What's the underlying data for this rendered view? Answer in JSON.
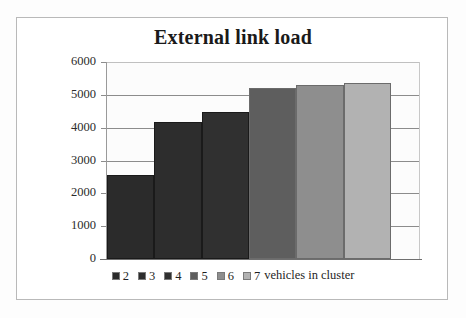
{
  "chart_data": {
    "type": "bar",
    "title": "External link load",
    "xlabel": "",
    "ylabel": "",
    "categories": [
      "2",
      "3",
      "4",
      "5",
      "6",
      "7"
    ],
    "values": [
      2570,
      4170,
      4480,
      5200,
      5300,
      5360
    ],
    "ylim": [
      0,
      6000
    ],
    "yticks": [
      "0",
      "1000",
      "2000",
      "3000",
      "4000",
      "5000",
      "6000"
    ],
    "ytick_values": [
      0,
      1000,
      2000,
      3000,
      4000,
      5000,
      6000
    ],
    "grid": true,
    "legend_position": "bottom",
    "series": [
      {
        "name": "2",
        "value": 2570,
        "color": "#2b2b2b"
      },
      {
        "name": "3",
        "value": 4170,
        "color": "#2d2d2d"
      },
      {
        "name": "4",
        "value": 4480,
        "color": "#303030"
      },
      {
        "name": "5",
        "value": 5200,
        "color": "#5e5e5e"
      },
      {
        "name": "6",
        "value": 5300,
        "color": "#8e8e8e"
      },
      {
        "name": "7",
        "value": 5360,
        "color": "#b2b2b2"
      }
    ]
  },
  "legend": {
    "entries": [
      {
        "label": "2",
        "color": "#2b2b2b"
      },
      {
        "label": "3",
        "color": "#2d2d2d"
      },
      {
        "label": "4",
        "color": "#303030"
      },
      {
        "label": "5",
        "color": "#5e5e5e"
      },
      {
        "label": "6",
        "color": "#8e8e8e"
      },
      {
        "label": "7",
        "color": "#b2b2b2"
      }
    ],
    "suffix": "vehicles in cluster"
  },
  "colors": {
    "frame_border": "#b9b9b9",
    "gridline": "#8c8c8c",
    "axis": "#6f6f6f",
    "text": "#1a1a1a",
    "background": "#ffffff"
  }
}
